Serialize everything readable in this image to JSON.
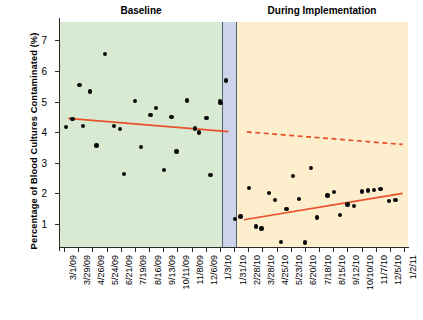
{
  "chart_data": {
    "type": "scatter",
    "title": "",
    "xlabel": "",
    "ylabel": "Percentage of Blood Cultures Contaminated (%)",
    "ylim": [
      0.25,
      7.6
    ],
    "yticks": [
      1,
      2,
      3,
      4,
      5,
      6,
      7
    ],
    "grid": false,
    "legend": "none",
    "panels": [
      {
        "name": "baseline",
        "label": "Baseline",
        "color": "#d9ead3",
        "x_start": "3/1/09",
        "x_end": "1/3/10"
      },
      {
        "name": "transition",
        "label": "",
        "color": "#ccd4ea",
        "x_start": "1/31/10",
        "x_end": "1/31/10"
      },
      {
        "name": "during-implementation",
        "label": "During Implementation",
        "color": "#fdeecd",
        "x_start": "2/28/10",
        "x_end": "1/2/11"
      }
    ],
    "xtick_labels": [
      "3/1/09",
      "3/29/09",
      "4/26/09",
      "5/24/09",
      "6/21/09",
      "7/19/09",
      "8/16/09",
      "9/13/09",
      "10/11/09",
      "11/8/09",
      "12/6/09",
      "1/3/10",
      "1/31/10",
      "2/28/10",
      "3/28/10",
      "4/25/10",
      "5/23/10",
      "6/20/10",
      "7/18/10",
      "8/15/10",
      "9/12/10",
      "10/10/10",
      "11/7/10",
      "12/5/10",
      "1/2/11"
    ],
    "series": [
      {
        "name": "Baseline observations",
        "marker": "filled-circle",
        "color": "#0a0a0a",
        "points": [
          {
            "i": 0.15,
            "y": 4.18
          },
          {
            "i": 0.6,
            "y": 4.43
          },
          {
            "i": 1.1,
            "y": 5.55
          },
          {
            "i": 1.35,
            "y": 4.21
          },
          {
            "i": 1.85,
            "y": 5.33
          },
          {
            "i": 2.3,
            "y": 3.57
          },
          {
            "i": 2.9,
            "y": 6.56
          },
          {
            "i": 3.55,
            "y": 4.2
          },
          {
            "i": 3.95,
            "y": 4.11
          },
          {
            "i": 4.25,
            "y": 2.64
          },
          {
            "i": 5.0,
            "y": 5.02
          },
          {
            "i": 5.45,
            "y": 3.51
          },
          {
            "i": 6.1,
            "y": 4.56
          },
          {
            "i": 6.5,
            "y": 4.8
          },
          {
            "i": 7.05,
            "y": 2.77
          },
          {
            "i": 7.6,
            "y": 4.5
          },
          {
            "i": 7.95,
            "y": 3.37
          },
          {
            "i": 8.7,
            "y": 5.04
          },
          {
            "i": 9.25,
            "y": 4.12
          },
          {
            "i": 9.55,
            "y": 3.99
          },
          {
            "i": 10.05,
            "y": 4.47
          },
          {
            "i": 10.35,
            "y": 2.6
          },
          {
            "i": 11.0,
            "y": 5.02
          },
          {
            "i": 11.05,
            "y": 4.96
          },
          {
            "i": 11.45,
            "y": 5.69
          }
        ]
      },
      {
        "name": "Transition observations",
        "marker": "filled-circle",
        "color": "#0a0a0a",
        "points": [
          {
            "i": 12.05,
            "y": 1.17
          },
          {
            "i": 12.45,
            "y": 1.25
          }
        ]
      },
      {
        "name": "During implementation observations",
        "marker": "filled-circle",
        "color": "#0a0a0a",
        "points": [
          {
            "i": 13.05,
            "y": 2.17
          },
          {
            "i": 13.55,
            "y": 0.92
          },
          {
            "i": 13.95,
            "y": 0.85
          },
          {
            "i": 14.45,
            "y": 2.01
          },
          {
            "i": 14.9,
            "y": 1.78
          },
          {
            "i": 15.3,
            "y": 0.42
          },
          {
            "i": 15.7,
            "y": 1.5
          },
          {
            "i": 16.15,
            "y": 2.56
          },
          {
            "i": 16.6,
            "y": 1.82
          },
          {
            "i": 17.0,
            "y": 0.4
          },
          {
            "i": 17.45,
            "y": 2.84
          },
          {
            "i": 17.85,
            "y": 1.21
          },
          {
            "i": 18.6,
            "y": 1.93
          },
          {
            "i": 19.05,
            "y": 2.04
          },
          {
            "i": 19.5,
            "y": 1.3
          },
          {
            "i": 20.0,
            "y": 1.64
          },
          {
            "i": 20.45,
            "y": 1.58
          },
          {
            "i": 21.05,
            "y": 2.06
          },
          {
            "i": 21.45,
            "y": 2.09
          },
          {
            "i": 21.9,
            "y": 2.11
          },
          {
            "i": 22.35,
            "y": 2.15
          },
          {
            "i": 22.95,
            "y": 1.75
          },
          {
            "i": 23.4,
            "y": 1.79
          }
        ]
      }
    ],
    "trend_lines": [
      {
        "name": "baseline-trend",
        "style": "solid",
        "color": "#e8502a",
        "x0": 0.3,
        "y0": 4.45,
        "x1": 11.6,
        "y1": 4.02
      },
      {
        "name": "counterfactual-projection",
        "style": "dashed",
        "color": "#e8502a",
        "x0": 12.9,
        "y0": 4.01,
        "x1": 23.9,
        "y1": 3.6
      },
      {
        "name": "implementation-trend",
        "style": "solid",
        "color": "#e8502a",
        "x0": 12.7,
        "y0": 1.14,
        "x1": 23.9,
        "y1": 2.0
      }
    ]
  },
  "labels": {
    "baseline_title": "Baseline",
    "implementation_title": "During Implementation",
    "y_axis_title": "Percentage of Blood Cultures Contaminated (%)"
  }
}
